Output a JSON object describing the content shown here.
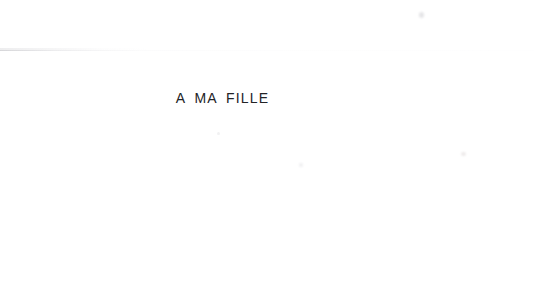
{
  "document": {
    "type": "scanned-book-page",
    "page_kind": "dedication",
    "background_color": "#ffffff",
    "text_color": "#232326"
  },
  "dedication": {
    "text": "A MA FILLE"
  },
  "artifacts": {
    "scan_line_label": "faint horizontal scan line",
    "speck_upper_right_label": "faint speck",
    "speck_mid_right_label": "faint speck",
    "speck_center_label": "faint speck",
    "speck_below_text_label": "faint speck"
  }
}
